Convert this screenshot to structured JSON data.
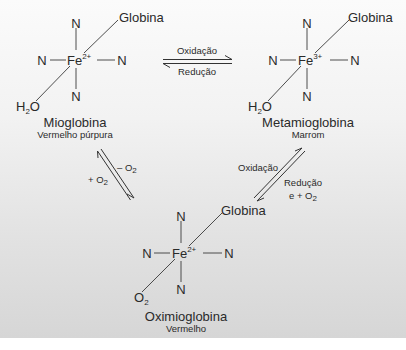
{
  "complexes": {
    "mioglobina": {
      "name": "Mioglobina",
      "color_desc": "Vermelho púrpura",
      "metal": "Fe",
      "charge": "2+",
      "ligand_top": "N",
      "ligand_left": "N",
      "ligand_right": "N",
      "ligand_bottom": "N",
      "protein": "Globina",
      "sixth_ligand": "H",
      "sixth_ligand_sub": "2",
      "sixth_ligand_tail": "O"
    },
    "metamioglobina": {
      "name": "Metamioglobina",
      "color_desc": "Marrom",
      "metal": "Fe",
      "charge": "3+",
      "ligand_top": "N",
      "ligand_left": "N",
      "ligand_right": "N",
      "ligand_bottom": "N",
      "protein": "Globina",
      "sixth_ligand": "H",
      "sixth_ligand_sub": "2",
      "sixth_ligand_tail": "O"
    },
    "oximioglobina": {
      "name": "Oximioglobina",
      "color_desc": "Vermelho",
      "metal": "Fe",
      "charge": "2+",
      "ligand_top": "N",
      "ligand_left": "N",
      "ligand_right": "N",
      "ligand_bottom": "N",
      "protein": "Globina",
      "sixth_ligand": "O",
      "sixth_ligand_sub": "2"
    }
  },
  "reactions": {
    "mio_meta": {
      "forward": "Oxidação",
      "reverse": "Redução"
    },
    "mio_oxi": {
      "forward": "– O",
      "forward_sub": "2",
      "reverse": "+ O",
      "reverse_sub": "2"
    },
    "oxi_meta": {
      "forward": "Oxidação",
      "reverse": "Redução",
      "reverse_extra": "e + O",
      "reverse_extra_sub": "2"
    }
  }
}
